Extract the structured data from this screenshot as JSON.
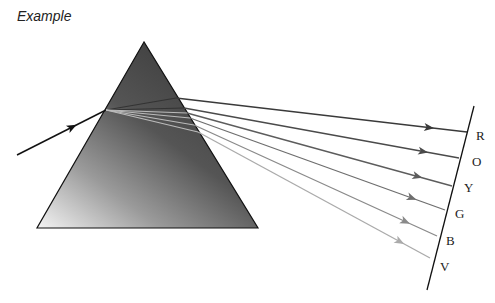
{
  "title": "Example",
  "diagram": {
    "type": "prism-dispersion",
    "prism": {
      "apex": [
        144,
        42
      ],
      "bottom_left": [
        37,
        228
      ],
      "bottom_right": [
        258,
        228
      ]
    },
    "incident_ray": {
      "from": [
        17,
        155
      ],
      "to": [
        106,
        110
      ]
    },
    "screen": {
      "from": [
        474,
        106
      ],
      "to": [
        427,
        290
      ]
    },
    "rays": [
      {
        "label": "R",
        "color": "#3a3a3a",
        "exit": [
          176,
          98
        ],
        "end": [
          467,
          132
        ],
        "text_pos": [
          476,
          140
        ]
      },
      {
        "label": "O",
        "color": "#4a4a4a",
        "exit": [
          184,
          108
        ],
        "end": [
          459,
          158
        ],
        "text_pos": [
          472,
          166
        ]
      },
      {
        "label": "Y",
        "color": "#5c5c5c",
        "exit": [
          187,
          113
        ],
        "end": [
          452,
          186
        ],
        "text_pos": [
          464,
          192
        ]
      },
      {
        "label": "G",
        "color": "#6e6e6e",
        "exit": [
          190,
          118
        ],
        "end": [
          445,
          210
        ],
        "text_pos": [
          455,
          218
        ]
      },
      {
        "label": "B",
        "color": "#8a8a8a",
        "exit": [
          194,
          125
        ],
        "end": [
          437,
          236
        ],
        "text_pos": [
          446,
          245
        ]
      },
      {
        "label": "V",
        "color": "#aaaaaa",
        "exit": [
          198,
          132
        ],
        "end": [
          430,
          258
        ],
        "text_pos": [
          440,
          271
        ]
      }
    ]
  }
}
